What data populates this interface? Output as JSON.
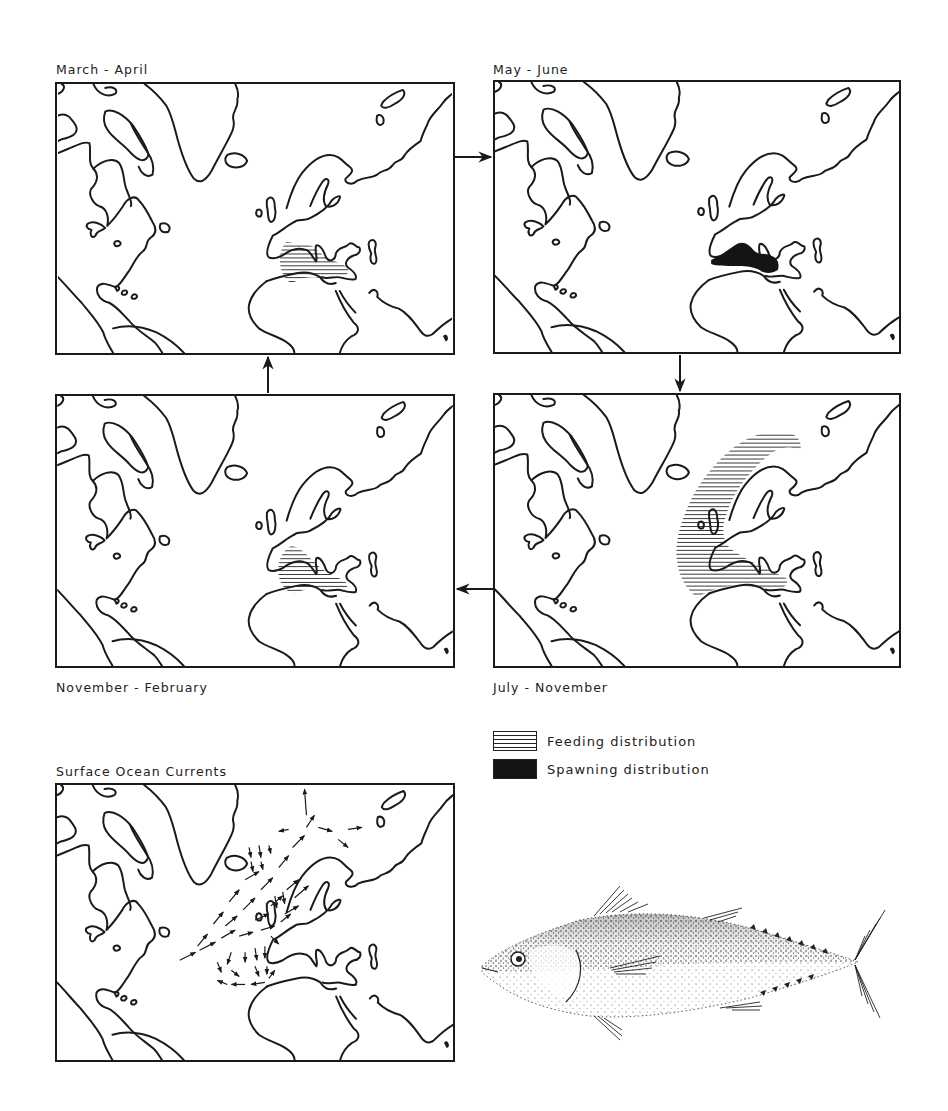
{
  "panels": [
    {
      "id": "march-april",
      "title": "March - April",
      "feeding": "mediterranean-small",
      "spawning": false
    },
    {
      "id": "may-june",
      "title": "May - June",
      "feeding": null,
      "spawning": true
    },
    {
      "id": "july-november",
      "title": "July - November",
      "feeding": "northeast-atlantic-wide",
      "spawning": false
    },
    {
      "id": "november-february",
      "title": "November - February",
      "feeding": "mediterranean-small",
      "spawning": false
    },
    {
      "id": "surface-currents",
      "title": "Surface Ocean Currents",
      "feeding": null,
      "spawning": false
    }
  ],
  "cycle_order": [
    "March - April",
    "May - June",
    "July - November",
    "November - February"
  ],
  "legend": {
    "feeding_label": "Feeding distribution",
    "spawning_label": "Spawning distribution"
  },
  "illustration": {
    "subject": "tuna-fish"
  },
  "colors": {
    "ink": "#1a1a1a",
    "paper": "#ffffff"
  }
}
